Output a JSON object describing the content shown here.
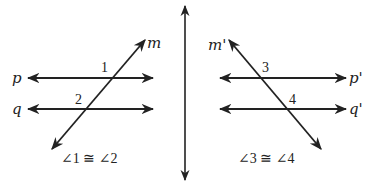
{
  "diagram": {
    "colors": {
      "line": "#222222",
      "background": "#ffffff"
    },
    "divider": {
      "x": 185,
      "y1": 6,
      "y2": 180
    },
    "left_figure": {
      "lines": [
        {
          "name": "p",
          "label": "p",
          "x1": 28,
          "y1": 78,
          "x2": 153,
          "y2": 78,
          "label_x": 12,
          "label_y": 83
        },
        {
          "name": "q",
          "label": "q",
          "x1": 28,
          "y1": 109,
          "x2": 153,
          "y2": 109,
          "label_x": 12,
          "label_y": 114
        },
        {
          "name": "m",
          "label": "m",
          "x1": 52,
          "y1": 149,
          "x2": 145,
          "y2": 40,
          "label_x": 147,
          "label_y": 48
        }
      ],
      "angles": [
        {
          "label": "1",
          "x": 101,
          "y": 72
        },
        {
          "label": "2",
          "x": 75,
          "y": 104
        }
      ],
      "statement": "∠1 ≅ ∠2",
      "statement_x": 61,
      "statement_y": 163
    },
    "right_figure": {
      "lines": [
        {
          "name": "p-prime",
          "label": "p'",
          "x1": 220,
          "y1": 78,
          "x2": 346,
          "y2": 78,
          "label_x": 349,
          "label_y": 83
        },
        {
          "name": "q-prime",
          "label": "q'",
          "x1": 220,
          "y1": 109,
          "x2": 346,
          "y2": 109,
          "label_x": 349,
          "label_y": 114
        },
        {
          "name": "m-prime",
          "label": "m'",
          "x1": 229,
          "y1": 40,
          "x2": 321,
          "y2": 149,
          "label_x": 208,
          "label_y": 50
        }
      ],
      "angles": [
        {
          "label": "3",
          "x": 262,
          "y": 72
        },
        {
          "label": "4",
          "x": 289,
          "y": 104
        }
      ],
      "statement": "∠3 ≅ ∠4",
      "statement_x": 238,
      "statement_y": 163
    }
  }
}
